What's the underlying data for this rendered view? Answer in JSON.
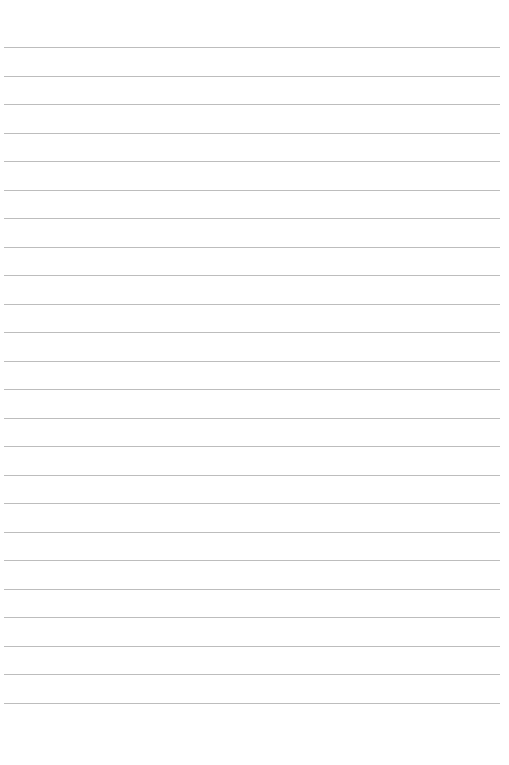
{
  "page": {
    "type": "lined-paper",
    "background_color": "#ffffff",
    "rule_color": "#bdbdbd",
    "rule_count": 24,
    "first_rule_y": 47,
    "rule_spacing": 28.5,
    "rule_left": 4,
    "rule_width": 496,
    "text": ""
  }
}
